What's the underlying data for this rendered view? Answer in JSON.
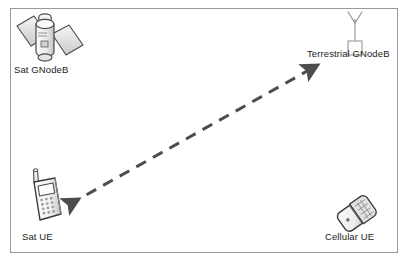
{
  "diagram": {
    "background_color": "#ffffff",
    "frame": {
      "border_color": "#9a9a9a",
      "x": 10,
      "y": 8,
      "width": 388,
      "height": 245
    },
    "nodes": [
      {
        "id": "sat-gnodeb",
        "label": "Sat GNodeB",
        "icon": "satellite-icon",
        "position": {
          "x": 18,
          "y": 12
        },
        "label_position": {
          "x": 14,
          "y": 64
        }
      },
      {
        "id": "terrestrial-gnodeb",
        "label": "Terrestrial GNodeB",
        "icon": "antenna-tower-icon",
        "position": {
          "x": 340,
          "y": 12
        },
        "label_position": {
          "x": 308,
          "y": 48
        }
      },
      {
        "id": "sat-ue",
        "label": "Sat UE",
        "icon": "candybar-phone-icon",
        "position": {
          "x": 24,
          "y": 170
        },
        "label_position": {
          "x": 22,
          "y": 231
        }
      },
      {
        "id": "cellular-ue",
        "label": "Cellular UE",
        "icon": "flip-phone-icon",
        "position": {
          "x": 330,
          "y": 192
        },
        "label_position": {
          "x": 325,
          "y": 231
        }
      }
    ],
    "connections": [
      {
        "id": "sat-ue-to-terrestrial-gnodeb",
        "from": "sat-ue",
        "to": "terrestrial-gnodeb",
        "style": "dashed",
        "arrowheads": "both",
        "color": "#4d4d4d",
        "stroke_width": 3,
        "dash_pattern": "11 8",
        "start_point": {
          "x": 70,
          "y": 204
        },
        "end_point": {
          "x": 309,
          "y": 70
        }
      }
    ],
    "colors": {
      "stroke": "#3a3a3a",
      "frame": "#9a9a9a",
      "arrow": "#4d4d4d",
      "icon_fill_light": "#f2f2f2",
      "icon_fill_mid": "#d9d9d9",
      "icon_fill_dark": "#bdbdbd",
      "text": "#1b1b1b"
    }
  }
}
